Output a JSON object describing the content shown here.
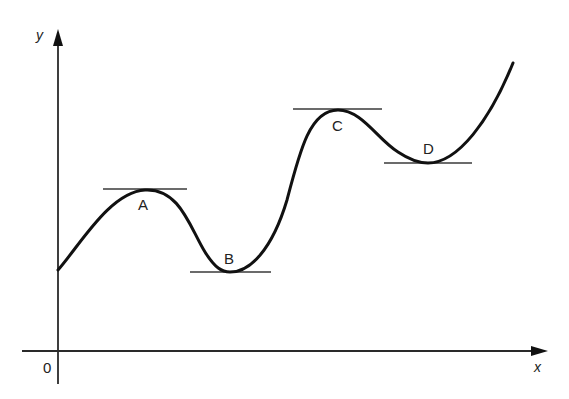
{
  "diagram": {
    "axes": {
      "x_label": "x",
      "y_label": "y",
      "origin_label": "0"
    },
    "stationary_points": [
      {
        "label": "A",
        "type": "local maximum"
      },
      {
        "label": "B",
        "type": "local minimum"
      },
      {
        "label": "C",
        "type": "local maximum"
      },
      {
        "label": "D",
        "type": "local minimum"
      }
    ],
    "colors": {
      "curve": "#111111",
      "axes": "#2a2a2a",
      "tangents": "#3a3a3a",
      "background": "#ffffff"
    }
  }
}
